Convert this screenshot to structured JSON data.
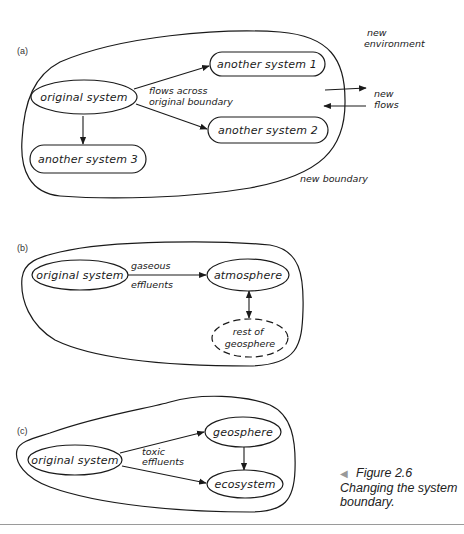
{
  "figure": {
    "number": "Figure 2.6",
    "title": "Changing the system boundary.",
    "caption_marker_icon": "left-triangle-icon",
    "panels": [
      {
        "label": "(a)",
        "nodes": {
          "original": "original system",
          "another1": "another system 1",
          "another2": "another system 2",
          "another3": "another system 3"
        },
        "annotations": {
          "flows_line1": "flows across",
          "flows_line2": "original boundary",
          "new_env_line1": "new",
          "new_env_line2": "environment",
          "new_flows_line1": "new",
          "new_flows_line2": "flows",
          "new_boundary": "new boundary"
        },
        "edges": [
          {
            "from": "original system",
            "to": "another system 1"
          },
          {
            "from": "original system",
            "to": "another system 2"
          },
          {
            "from": "original system",
            "to": "another system 3"
          }
        ]
      },
      {
        "label": "(b)",
        "nodes": {
          "original": "original system",
          "atmosphere": "atmosphere",
          "rest_line1": "rest of",
          "rest_line2": "geosphere"
        },
        "annotations": {
          "gaseous": "gaseous",
          "effluents": "effluents"
        },
        "edges": [
          {
            "from": "original system",
            "to": "atmosphere",
            "label": "gaseous effluents"
          },
          {
            "from": "atmosphere",
            "to": "rest of geosphere",
            "bidirectional": true
          }
        ]
      },
      {
        "label": "(c)",
        "nodes": {
          "original": "original system",
          "geosphere": "geosphere",
          "ecosystem": "ecosystem"
        },
        "annotations": {
          "toxic": "toxic",
          "effluents": "effluents"
        },
        "edges": [
          {
            "from": "original system",
            "to": "geosphere"
          },
          {
            "from": "original system",
            "to": "ecosystem",
            "label": "toxic effluents"
          },
          {
            "from": "geosphere",
            "to": "ecosystem"
          }
        ]
      }
    ]
  }
}
